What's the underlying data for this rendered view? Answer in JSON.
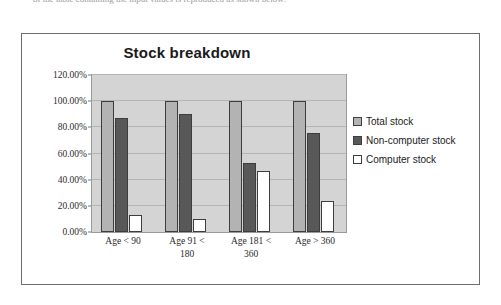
{
  "page": {
    "clipped_header_text": "of the table containing the input values is reproduced as shown below:"
  },
  "colors": {
    "plot_background": "#d4d4d4",
    "gridline": "#b4b4b4",
    "frame_border": "#6e6e6e",
    "bar_outline": "#3d3d3d",
    "total_stock": "#b3b3b3",
    "non_computer_stock": "#585858",
    "computer_stock": "#ffffff",
    "text": "#1a1a1a"
  },
  "chart_data": {
    "type": "bar",
    "title": "Stock breakdown",
    "xlabel": "",
    "ylabel": "",
    "ylim": [
      0,
      120
    ],
    "ytick_labels": [
      "0.00%",
      "20.00%",
      "40.00%",
      "60.00%",
      "80.00%",
      "100.00%",
      "120.00%"
    ],
    "ytick_values": [
      0,
      20,
      40,
      60,
      80,
      100,
      120
    ],
    "grid": true,
    "legend_position": "right",
    "categories": [
      "Age < 90",
      "Age 91 < 180",
      "Age 181 < 360",
      "Age > 360"
    ],
    "category_lines": [
      [
        "Age < 90"
      ],
      [
        "Age 91 <",
        "180"
      ],
      [
        "Age 181 <",
        "360"
      ],
      [
        "Age > 360"
      ]
    ],
    "series": [
      {
        "name": "Total stock",
        "color": "#b3b3b3",
        "values": [
          100,
          100,
          100,
          100
        ]
      },
      {
        "name": "Non-computer stock",
        "color": "#585858",
        "values": [
          87,
          90,
          53,
          76
        ]
      },
      {
        "name": "Computer stock",
        "color": "#ffffff",
        "values": [
          13,
          10,
          47,
          24
        ]
      }
    ]
  }
}
